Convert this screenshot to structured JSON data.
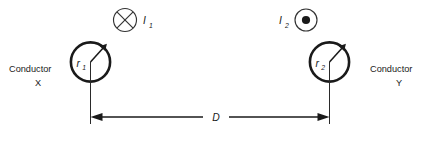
{
  "figure": {
    "type": "physics-diagram",
    "background_color": "#ffffff",
    "line_color": "#1a1a1a"
  },
  "current_symbols": [
    {
      "label": "I",
      "subscript": "1",
      "icon": "circle-cross-icon",
      "meaning": "current into page",
      "label_side": "right"
    },
    {
      "label": "I",
      "subscript": "2",
      "icon": "circle-dot-icon",
      "meaning": "current out of page",
      "label_side": "left"
    }
  ],
  "conductors": [
    {
      "name_line1": "Conductor",
      "name_line2": "X",
      "radius_label": "r",
      "radius_subscript": "1",
      "label_side": "left"
    },
    {
      "name_line1": "Conductor",
      "name_line2": "Y",
      "radius_label": "r",
      "radius_subscript": "2",
      "label_side": "right"
    }
  ],
  "separation": {
    "label": "D",
    "description": "centre-to-centre separation dimension"
  }
}
